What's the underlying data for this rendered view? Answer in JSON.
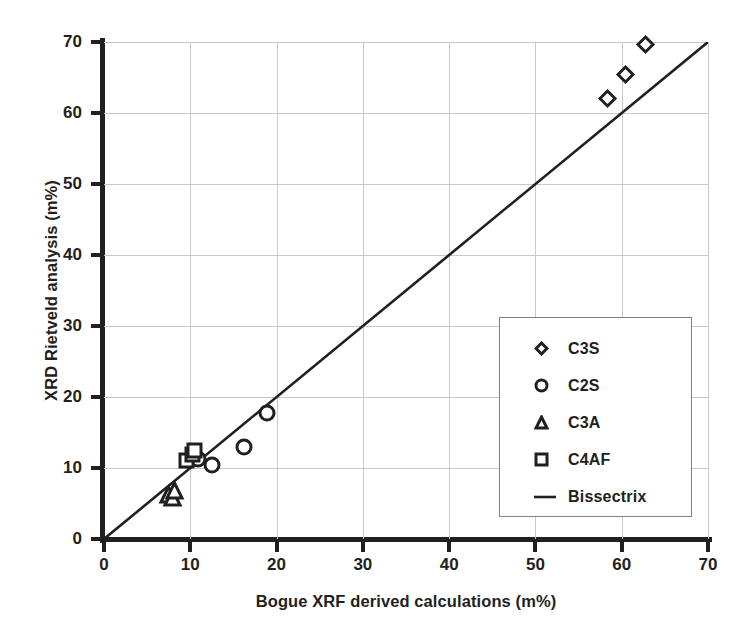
{
  "chart_data": {
    "type": "scatter",
    "title": "",
    "xlabel": "Bogue XRF derived calculations (m%)",
    "ylabel": "XRD Rietveld analysis (m%)",
    "xlim": [
      0,
      70
    ],
    "ylim": [
      0,
      70
    ],
    "xticks": [
      0,
      10,
      20,
      30,
      40,
      50,
      60,
      70
    ],
    "yticks": [
      0,
      10,
      20,
      30,
      40,
      50,
      60,
      70
    ],
    "grid": true,
    "legend_position": "center-right",
    "marker_color": "#231f20",
    "line_color": "#231f20",
    "grid_color": "#c9c9c9",
    "axis_color": "#231f20",
    "series": [
      {
        "name": "C3S",
        "marker": "diamond",
        "points": [
          {
            "x": 58.3,
            "y": 62.1
          },
          {
            "x": 60.4,
            "y": 65.4
          },
          {
            "x": 62.7,
            "y": 69.6
          }
        ]
      },
      {
        "name": "C2S",
        "marker": "circle",
        "points": [
          {
            "x": 10.9,
            "y": 11.2
          },
          {
            "x": 12.5,
            "y": 10.4
          },
          {
            "x": 16.2,
            "y": 12.9
          },
          {
            "x": 18.9,
            "y": 17.7
          }
        ]
      },
      {
        "name": "C3A",
        "marker": "triangle",
        "points": [
          {
            "x": 7.5,
            "y": 6.3
          },
          {
            "x": 7.9,
            "y": 5.9
          },
          {
            "x": 8.2,
            "y": 6.9
          }
        ]
      },
      {
        "name": "C4AF",
        "marker": "square",
        "points": [
          {
            "x": 9.6,
            "y": 11.0
          },
          {
            "x": 10.2,
            "y": 11.9
          },
          {
            "x": 10.5,
            "y": 12.4
          }
        ]
      }
    ],
    "reference_line": {
      "name": "Bissectrix",
      "marker": "line",
      "from": {
        "x": 0,
        "y": 0
      },
      "to": {
        "x": 70,
        "y": 70
      }
    }
  },
  "legend": {
    "items": [
      {
        "label": "C3S",
        "marker": "diamond"
      },
      {
        "label": "C2S",
        "marker": "circle"
      },
      {
        "label": "C3A",
        "marker": "triangle"
      },
      {
        "label": "C4AF",
        "marker": "square"
      },
      {
        "label": "Bissectrix",
        "marker": "line"
      }
    ]
  }
}
